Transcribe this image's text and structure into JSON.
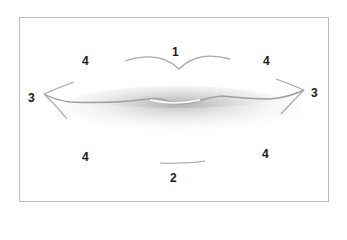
{
  "diagram": {
    "labels": [
      {
        "id": "upper-lip-center",
        "text": "1",
        "x": 172,
        "y": 46
      },
      {
        "id": "lower-lip-center",
        "text": "2",
        "x": 170,
        "y": 172
      },
      {
        "id": "left-corner",
        "text": "3",
        "x": 28,
        "y": 92
      },
      {
        "id": "right-corner",
        "text": "3",
        "x": 311,
        "y": 87
      },
      {
        "id": "upper-left",
        "text": "4",
        "x": 82,
        "y": 55
      },
      {
        "id": "upper-right",
        "text": "4",
        "x": 263,
        "y": 55
      },
      {
        "id": "lower-left",
        "text": "4",
        "x": 82,
        "y": 151
      },
      {
        "id": "lower-right",
        "text": "4",
        "x": 262,
        "y": 148
      }
    ],
    "colors": {
      "line": "#a8a8a8",
      "shade": "#9a9a9a",
      "label": "#1a1a1a",
      "frame": "#bdbdbd"
    }
  }
}
